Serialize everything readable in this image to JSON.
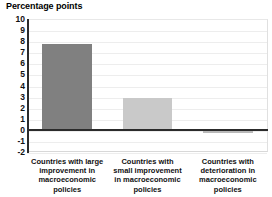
{
  "chart_data": {
    "type": "bar",
    "title": "Percentage points",
    "xlabel": "",
    "ylabel": "Percentage points",
    "ylim": [
      -2,
      10
    ],
    "grid": true,
    "legend": "none",
    "categories": [
      "Countries with large improvement in macroeconomic policies",
      "Countries with small improvement in macroeconomic policies",
      "Countries with deterioration in macroeconomic policies"
    ],
    "category_lines": [
      "Countries with large\nimprovement in\nmacroeconomic\npolicies",
      "Countries with\nsmall improvement\nin macroeconomic\npolicies",
      "Countries with\ndeterioration in\nmacroeconomic\npolicies"
    ],
    "values": [
      7.8,
      3.0,
      -0.2
    ],
    "bar_colors": [
      "#808080",
      "#c9c9c9",
      "#b9b9b9"
    ],
    "ytick_labels": [
      "10",
      "9",
      "8",
      "7",
      "6",
      "5",
      "4",
      "3",
      "2",
      "1",
      "0",
      "-1",
      "-2"
    ],
    "ytick_values": [
      10,
      9,
      8,
      7,
      6,
      5,
      4,
      3,
      2,
      1,
      0,
      -1,
      -2
    ]
  },
  "colors": {
    "axis": "#2b2b2b",
    "grid": "#ededed",
    "text": "#111111",
    "background": "#ffffff"
  }
}
